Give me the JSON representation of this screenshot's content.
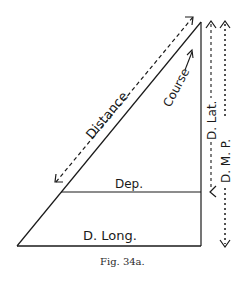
{
  "figure": {
    "caption": "Fig. 34a.",
    "labels": {
      "distance": "Distance",
      "course": "Course",
      "dep": "Dep.",
      "d_long": "D. Long.",
      "d_lat": "D. Lat.",
      "d_mp": "D. M. P."
    },
    "colors": {
      "ink": "#1a1a1a",
      "background": "#ffffff"
    }
  }
}
